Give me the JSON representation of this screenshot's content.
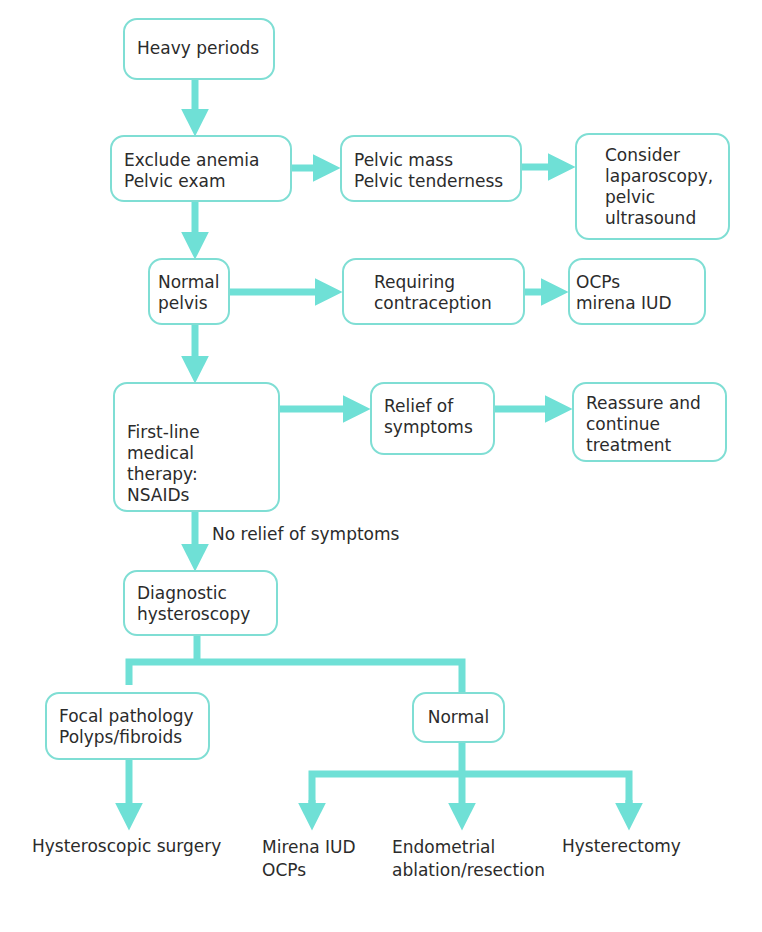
{
  "colors": {
    "accent": "#6fe0d6",
    "box_border": "#7fded4",
    "text": "#2b2b2b",
    "background": "#ffffff"
  },
  "nodes": {
    "heavy_periods": "Heavy periods",
    "exclude_anemia": "Exclude anemia\nPelvic exam",
    "pelvic_mass": "Pelvic mass\nPelvic tenderness",
    "consider_laparoscopy": "Consider\nlaparoscopy,\npelvic\nultrasound",
    "normal_pelvis": "Normal\npelvis",
    "requiring_contraception": "Requiring\ncontraception",
    "ocps_mirena": "OCPs\nmirena IUD",
    "first_line": "First-line\nmedical therapy:\nNSAIDs",
    "relief": "Relief of\nsymptoms",
    "reassure": "Reassure and\ncontinue\ntreatment",
    "diagnostic_hysteroscopy": "Diagnostic\nhysteroscopy",
    "focal_pathology": "Focal pathology\nPolyps/fibroids",
    "normal": "Normal"
  },
  "edge_labels": {
    "no_relief": "No relief of symptoms"
  },
  "outcomes": {
    "hysteroscopic_surgery": "Hysteroscopic surgery",
    "mirena_ocps": "Mirena IUD\nOCPs",
    "endometrial_ablation": "Endometrial\nablation/resection",
    "hysterectomy": "Hysterectomy"
  }
}
